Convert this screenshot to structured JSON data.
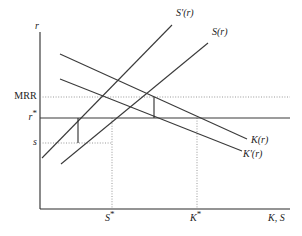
{
  "figure": {
    "type": "economics-line-diagram",
    "background_color": "#ffffff",
    "line_color": "#3a3a3a",
    "guide_color": "#8d8d8d"
  },
  "axes": {
    "y_label": "r",
    "x_label": "K, S",
    "y_axis_x": 40,
    "x_axis_y": 209,
    "y_axis_top": 32,
    "x_axis_right": 290
  },
  "y_ticks": [
    {
      "label": "MRR",
      "y": 97
    },
    {
      "label": "r*",
      "y": 118
    },
    {
      "label": "s",
      "y": 143
    }
  ],
  "x_ticks": [
    {
      "label": "S*",
      "x": 112
    },
    {
      "label": "K*",
      "x": 197
    }
  ],
  "curves": [
    {
      "name": "S'(r)",
      "label": "S'(r)",
      "slope": "upward",
      "x1": 42,
      "y1": 158,
      "x2": 172,
      "y2": 25,
      "label_x": 176,
      "label_y": 8
    },
    {
      "name": "S(r)",
      "label": "S(r)",
      "slope": "upward",
      "x1": 61,
      "y1": 164,
      "x2": 208,
      "y2": 43,
      "label_x": 212,
      "label_y": 27
    },
    {
      "name": "K(r)",
      "label": "K(r)",
      "slope": "downward",
      "x1": 60,
      "y1": 54,
      "x2": 247,
      "y2": 139,
      "label_x": 251,
      "label_y": 135
    },
    {
      "name": "K'(r)",
      "label": "K'(r)",
      "slope": "downward",
      "x1": 60,
      "y1": 79,
      "x2": 242,
      "y2": 151,
      "label_x": 243,
      "label_y": 149
    }
  ],
  "level_lines": [
    {
      "name": "r-star-horizontal",
      "y": 118,
      "x1": 40,
      "x2": 290
    }
  ],
  "guide_lines": [
    {
      "name": "mrr-horizontal-dotted",
      "x1": 40,
      "y1": 97,
      "x2": 290,
      "y2": 97
    },
    {
      "name": "s-horizontal-dotted",
      "x1": 40,
      "y1": 143,
      "x2": 112,
      "y2": 143
    },
    {
      "name": "s-star-vertical-dotted",
      "x1": 112,
      "y1": 118,
      "x2": 112,
      "y2": 209
    },
    {
      "name": "k-star-vertical-dotted",
      "x1": 197,
      "y1": 118,
      "x2": 197,
      "y2": 209
    }
  ],
  "marker_segments": [
    {
      "name": "left-wedge-vertical",
      "x": 78,
      "y_top": 118,
      "y_bottom": 143
    },
    {
      "name": "right-wedge-vertical",
      "x": 154,
      "y_top": 97,
      "y_bottom": 118
    }
  ]
}
